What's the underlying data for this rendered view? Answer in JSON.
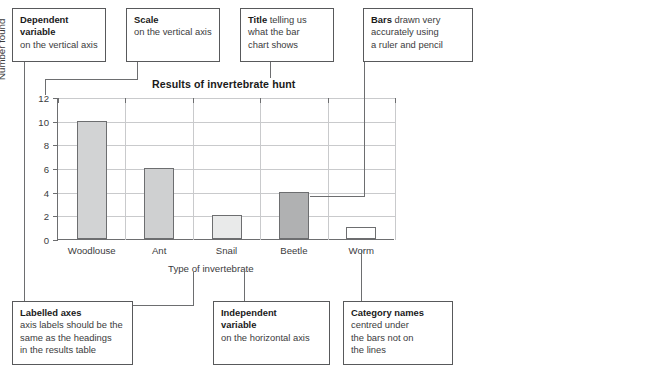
{
  "chart_data": {
    "type": "bar",
    "title": "Results of invertebrate hunt",
    "xlabel": "Type of invertebrate",
    "ylabel": "Number found",
    "categories": [
      "Woodlouse",
      "Ant",
      "Snail",
      "Beetle",
      "Worm"
    ],
    "values": [
      10,
      6,
      2,
      4,
      1
    ],
    "ylim": [
      0,
      12
    ],
    "ytick_values": [
      0,
      2,
      4,
      6,
      8,
      10,
      12
    ],
    "ytick_labels": [
      "0",
      "2",
      "4",
      "6",
      "8",
      "10",
      "12"
    ],
    "grid": "both",
    "legend": "none",
    "bar_colors": [
      "#d2d3d4",
      "#cfd0d1",
      "#e9eaea",
      "#b0b1b2",
      "#ffffff"
    ],
    "bar_border_color": "#6d6e70"
  },
  "axis_titles": {
    "y": "Number found",
    "x": "Type of invertebrate"
  },
  "callouts": {
    "dependent_variable": {
      "heading": "Dependent",
      "heading2": "variable",
      "body": "on the vertical axis"
    },
    "scale": {
      "heading": "Scale",
      "body": "on the vertical axis"
    },
    "title": {
      "heading": "Title",
      "body_line1": " telling us",
      "body_line2": "what the bar",
      "body_line3": "chart shows"
    },
    "bars": {
      "heading": "Bars",
      "body_line1": " drawn very",
      "body_line2": "accurately using",
      "body_line3": "a ruler and pencil"
    },
    "labelled_axes": {
      "heading": "Labelled axes",
      "body_line1": "axis labels should be the",
      "body_line2": "same as the headings",
      "body_line3": "in the results table"
    },
    "independent_variable": {
      "heading": "Independent",
      "heading2": "variable",
      "body": "on the horizontal axis"
    },
    "category_names": {
      "heading": "Category names",
      "body_line1": "centred under",
      "body_line2": "the bars not on",
      "body_line3": "the lines"
    }
  }
}
